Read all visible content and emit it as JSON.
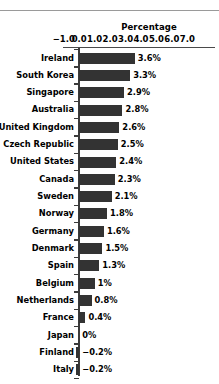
{
  "chart_data": {
    "type": "bar",
    "orientation": "horizontal",
    "title": "Percentage",
    "xlabel": "Percentage",
    "ylabel": "",
    "xlim": [
      -1.0,
      7.0
    ],
    "grid": false,
    "legend": null,
    "tick_labels": [
      "−1.0",
      "0.0",
      "1.0",
      "2.0",
      "3.0",
      "4.0",
      "5.0",
      "6.0",
      "7.0"
    ],
    "tick_values": [
      -1.0,
      0.0,
      1.0,
      2.0,
      3.0,
      4.0,
      5.0,
      6.0,
      7.0
    ],
    "bar_color": "#333333",
    "categories": [
      "Ireland",
      "South Korea",
      "Singapore",
      "Australia",
      "United Kingdom",
      "Czech Republic",
      "United States",
      "Canada",
      "Sweden",
      "Norway",
      "Germany",
      "Denmark",
      "Spain",
      "Belgium",
      "Netherlands",
      "France",
      "Japan",
      "Finland",
      "Italy"
    ],
    "values": [
      3.6,
      3.3,
      2.9,
      2.8,
      2.6,
      2.5,
      2.4,
      2.3,
      2.1,
      1.8,
      1.6,
      1.5,
      1.3,
      1.0,
      0.8,
      0.4,
      0.0,
      -0.2,
      -0.2
    ],
    "data_labels": [
      "3.6%",
      "3.3%",
      "2.9%",
      "2.8%",
      "2.6%",
      "2.5%",
      "2.4%",
      "2.3%",
      "2.1%",
      "1.8%",
      "1.6%",
      "1.5%",
      "1.3%",
      "1%",
      "0.8%",
      "0.4%",
      "0%",
      "−0.2%",
      "−0.2%"
    ]
  }
}
